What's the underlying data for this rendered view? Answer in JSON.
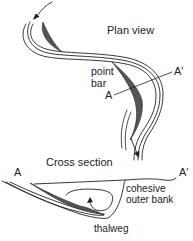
{
  "figure": {
    "colors": {
      "line": "#222222",
      "point_bar_fill": "#555555",
      "background": "#ffffff"
    }
  },
  "plan_view": {
    "title": "Plan view",
    "point_bar_label_line1": "point",
    "point_bar_label_line2": "bar",
    "section_start_label": "A",
    "section_end_label": "A′"
  },
  "cross_section": {
    "title": "Cross section",
    "left_label": "A",
    "right_label": "A′",
    "bank_label_line1": "cohesive",
    "bank_label_line2": "outer bank",
    "thalweg_label": "thalweg"
  }
}
